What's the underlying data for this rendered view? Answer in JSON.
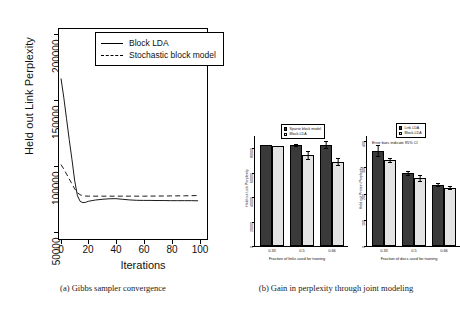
{
  "figure": {
    "captions": [
      {
        "id": "a",
        "text": "(a) Gibbs sampler convergence"
      },
      {
        "id": "b",
        "text": "(b) Gain in perplexity through joint modeling"
      }
    ]
  },
  "chart_data": [
    {
      "id": "gibbs-convergence",
      "type": "line",
      "title": "",
      "xlabel": "Iterations",
      "ylabel": "Held out Link Perplexity",
      "xlim": [
        0,
        105
      ],
      "ylim": [
        45000,
        210000
      ],
      "xticks": [
        0,
        20,
        40,
        60,
        80,
        100
      ],
      "yticks": [
        50000,
        100000,
        150000,
        200000
      ],
      "ytick_labels": [
        "50000",
        "100000",
        "150000",
        "200000"
      ],
      "grid": false,
      "legend_position": "top-right",
      "series": [
        {
          "name": "Block LDA",
          "style": "solid",
          "x": [
            0,
            2,
            4,
            6,
            8,
            10,
            12,
            14,
            16,
            18,
            20,
            25,
            30,
            35,
            40,
            45,
            50,
            55,
            60,
            65,
            70,
            75,
            80,
            85,
            90,
            95,
            100
          ],
          "y": [
            172000,
            157000,
            140000,
            123000,
            107000,
            90000,
            78000,
            73500,
            72500,
            72800,
            73600,
            74600,
            75200,
            75600,
            75700,
            75200,
            74700,
            74400,
            74300,
            74300,
            74200,
            74200,
            74100,
            74100,
            74100,
            74100,
            74000
          ]
        },
        {
          "name": "Stochastic block model",
          "style": "dashed",
          "x": [
            0,
            2,
            4,
            6,
            8,
            10,
            12,
            14,
            16,
            18,
            20,
            30,
            40,
            50,
            60,
            70,
            80,
            90,
            100
          ],
          "y": [
            103000,
            99500,
            95500,
            91500,
            87500,
            83500,
            80500,
            78800,
            78100,
            77800,
            77700,
            77700,
            77700,
            77700,
            77700,
            77800,
            77900,
            78000,
            78200
          ]
        }
      ]
    },
    {
      "id": "link-perplexity",
      "type": "bar",
      "title": "",
      "xlabel": "Fraction of links used for training",
      "ylabel": "Held out Link Perplexity",
      "categories": [
        "0.33",
        "0.5",
        "0.66"
      ],
      "ylim": [
        0,
        90000
      ],
      "yticks": [
        0,
        20000,
        40000,
        60000,
        80000
      ],
      "ytick_labels": [
        "0",
        "20000",
        "40000",
        "60000",
        "80000"
      ],
      "grid": false,
      "legend_position": "top-center",
      "series": [
        {
          "name": "Sparse block model",
          "fill": "dark",
          "values": [
            82500,
            82500,
            82500
          ],
          "errors": [
            0,
            900,
            3200
          ]
        },
        {
          "name": "Block-LDA",
          "fill": "light",
          "values": [
            81500,
            74500,
            68500
          ],
          "errors": [
            500,
            3500,
            3200
          ]
        }
      ]
    },
    {
      "id": "protein-perplexity",
      "type": "bar",
      "title": "",
      "xlabel": "Fraction of docs used for training",
      "ylabel": "Held out Protein Perplexity",
      "categories": [
        "0.33",
        "0.5",
        "0.66"
      ],
      "ylim": [
        0,
        420
      ],
      "yticks": [
        0,
        100,
        200,
        300,
        400
      ],
      "ytick_labels": [
        "0",
        "100",
        "200",
        "300",
        "400"
      ],
      "grid": false,
      "legend_position": "top-right",
      "annotation": "Error bars indicate 95% CI",
      "series": [
        {
          "name": "Link LDA",
          "fill": "dark",
          "values": [
            362,
            278,
            233
          ],
          "errors": [
            22,
            9,
            7
          ]
        },
        {
          "name": "Block-LDA",
          "fill": "light",
          "values": [
            327,
            258,
            222
          ],
          "errors": [
            9,
            14,
            7
          ]
        }
      ]
    }
  ]
}
